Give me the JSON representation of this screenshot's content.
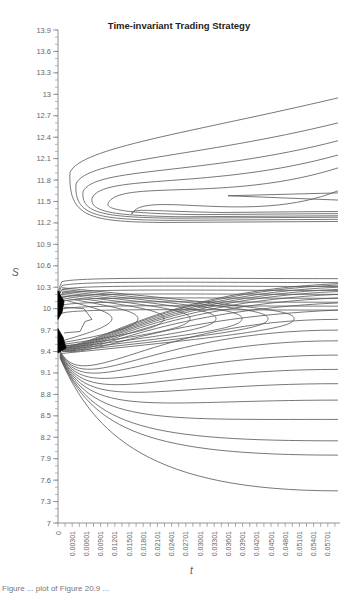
{
  "chart_data": {
    "type": "contour",
    "title": "Time-invariant Trading Strategy",
    "xlabel": "t",
    "ylabel": "S",
    "xlim": [
      0,
      0.0585
    ],
    "ylim": [
      7,
      13.9
    ],
    "y_ticks": [
      "7",
      "7.3",
      "7.6",
      "7.9",
      "8.2",
      "8.5",
      "8.8",
      "9.1",
      "9.4",
      "9.7",
      "10",
      "10.3",
      "10.6",
      "10.9",
      "11.2",
      "11.5",
      "11.8",
      "12.1",
      "12.4",
      "12.7",
      "13",
      "13.3",
      "13.6",
      "13.9"
    ],
    "x_ticks": [
      "0",
      "0.00301",
      "0.00601",
      "0.00901",
      "0.01201",
      "0.01501",
      "0.01801",
      "0.02101",
      "0.02401",
      "0.02701",
      "0.03001",
      "0.03301",
      "0.03601",
      "0.03901",
      "0.04201",
      "0.04501",
      "0.04801",
      "0.05101",
      "0.05401",
      "0.05701"
    ],
    "grid": false,
    "legend": null,
    "regions": [
      {
        "name": "upper contour family",
        "S_range": [
          11.2,
          12.95
        ],
        "apex_t": 0.0003,
        "apex_S": 11.3,
        "count": 8
      },
      {
        "name": "middle contour family",
        "S_range": [
          9.5,
          10.45
        ],
        "converges_at": {
          "t": 0,
          "S": 9.85
        },
        "count": 20
      },
      {
        "name": "lower contour family",
        "S_range": [
          7.45,
          9.55
        ],
        "fanning_from": {
          "t": 0,
          "S": 9.5
        },
        "count": 12
      }
    ]
  },
  "caption": "Figure ... plot of Figure 20.9 ..."
}
